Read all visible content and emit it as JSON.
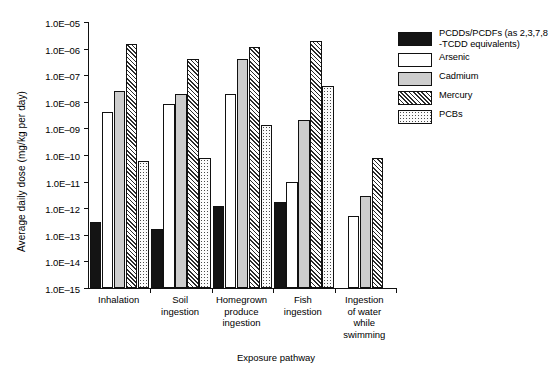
{
  "chart_data": {
    "type": "bar",
    "title": "",
    "xlabel": "Exposure pathway",
    "ylabel": "Average daily dose (mg/kg per day)",
    "yscale": "log",
    "ylim": [
      1e-15,
      1e-05
    ],
    "ytick_labels": [
      "1.0E–05",
      "1.0E–06",
      "1.0E–07",
      "1.0E–08",
      "1.0E–09",
      "1.0E–10",
      "1.0E–11",
      "1.0E–12",
      "1.0E–13",
      "1.0E–14",
      "1.0E–15"
    ],
    "ytick_values": [
      1e-05,
      1e-06,
      1e-07,
      1e-08,
      1e-09,
      1e-10,
      1e-11,
      1e-12,
      1e-13,
      1e-14,
      1e-15
    ],
    "grid": false,
    "legend_position": "right",
    "categories": [
      "Inhalation",
      "Soil\ningestion",
      "Homegrown\nproduce\ningestion",
      "Fish\ningestion",
      "Ingestion\nof water\nwhile\nswimming"
    ],
    "series": [
      {
        "name": "PCDDs/PCDFs (as 2,3,7,8\n-TCDD equivalents)",
        "legend_line1": "PCDDs/PCDFs (as 2,3,7,8",
        "legend_line2": "-TCDD equivalents)",
        "fill": "solid-black",
        "color": "#141414",
        "values": [
          3e-13,
          1.7e-13,
          1.2e-12,
          1.7e-12,
          null
        ]
      },
      {
        "name": "Arsenic",
        "fill": "white",
        "color": "#ffffff",
        "values": [
          4e-09,
          8e-09,
          2e-08,
          1e-11,
          5e-13
        ]
      },
      {
        "name": "Cadmium",
        "fill": "light-gray-stipple",
        "color": "#cdcdcd",
        "values": [
          2.5e-08,
          2e-08,
          4e-07,
          2e-09,
          3e-12
        ]
      },
      {
        "name": "Mercury",
        "fill": "diagonal-hatch",
        "color": "#2b2b2b",
        "values": [
          1.5e-06,
          4e-07,
          1.2e-06,
          2e-06,
          8e-11
        ]
      },
      {
        "name": "PCBs",
        "fill": "dotted",
        "color": "#4a4a4a",
        "values": [
          6e-11,
          8e-11,
          1.3e-09,
          4e-08,
          null
        ]
      }
    ]
  }
}
